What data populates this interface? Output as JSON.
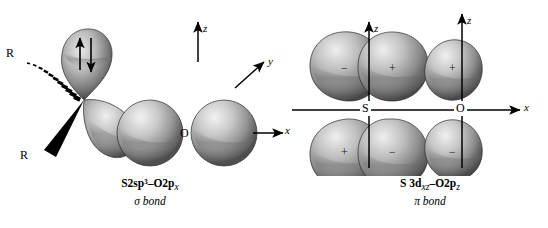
{
  "figure": {
    "background_color": "#ffffff",
    "ink_color": "#000000",
    "orbital_fill_light": "#d8d8d8",
    "orbital_fill_mid": "#9a9a9a",
    "orbital_fill_dark": "#4a4a4a"
  },
  "panels": [
    {
      "id": "sigma",
      "caption_line1": "S2sp³–O2p",
      "caption_line1_sub": "x",
      "caption_line2": "σ bond",
      "axes": [
        {
          "name": "z",
          "label": "z",
          "direction": "up"
        },
        {
          "name": "y",
          "label": "y",
          "direction": "up-right"
        },
        {
          "name": "x",
          "label": "x",
          "direction": "right"
        }
      ],
      "atom_labels": [
        {
          "name": "oxygen",
          "label": "O"
        }
      ],
      "substituents": [
        {
          "name": "R-hashed",
          "label": "R",
          "bond_style": "hashed-wedge"
        },
        {
          "name": "R-solid",
          "label": "R",
          "bond_style": "solid-wedge"
        }
      ],
      "lone_pair": {
        "name": "lone-pair-arrows",
        "up_arrow": "↑",
        "down_arrow": "↓",
        "count": 2
      }
    },
    {
      "id": "pi",
      "caption_line1a": "S 3d",
      "caption_line1a_sub": "xz",
      "caption_line1b": "–O2p",
      "caption_line1b_sub": "z",
      "caption_line2": "π bond",
      "axes": [
        {
          "name": "z-sulfur",
          "label": "z",
          "direction": "up"
        },
        {
          "name": "z-oxygen",
          "label": "z",
          "direction": "up"
        },
        {
          "name": "x",
          "label": "x",
          "direction": "right"
        }
      ],
      "atom_labels": [
        {
          "name": "sulfur",
          "label": "S"
        },
        {
          "name": "oxygen",
          "label": "O"
        }
      ],
      "lobe_signs": {
        "top_row": [
          "−",
          "+",
          "+"
        ],
        "bottom_row": [
          "+",
          "−",
          "−"
        ]
      }
    }
  ]
}
